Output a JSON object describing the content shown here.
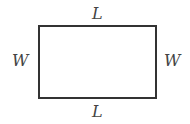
{
  "diagram": {
    "shape": "rectangle",
    "labels": {
      "top": "L",
      "bottom": "L",
      "left": "W",
      "right": "W"
    }
  }
}
